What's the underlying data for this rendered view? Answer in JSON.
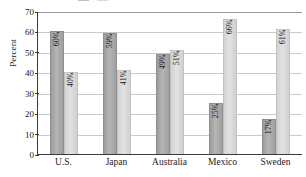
{
  "chart_data": {
    "type": "bar",
    "title": "",
    "xlabel": "",
    "ylabel": "Percent",
    "ylim": [
      0,
      70
    ],
    "ytick_labels": [
      "70",
      "60",
      "50",
      "40",
      "30",
      "20",
      "10",
      "0"
    ],
    "ytick_values": [
      70,
      60,
      50,
      40,
      30,
      20,
      10,
      0
    ],
    "grid": true,
    "legend_position": "top",
    "categories": [
      "U.S.",
      "Japan",
      "Australia",
      "Mexico",
      "Sweden"
    ],
    "series": [
      {
        "name": "series-a",
        "color": "#a8a8a8",
        "values": [
          60,
          59,
          49,
          25,
          17
        ],
        "labels": [
          "60%",
          "59%",
          "49%",
          "25%",
          "17%"
        ]
      },
      {
        "name": "series-b",
        "color": "#d8d8d8",
        "values": [
          40,
          41,
          51,
          66,
          61
        ],
        "labels": [
          "40%",
          "41%",
          "51%",
          "66%",
          "61%"
        ]
      }
    ]
  },
  "axis": {
    "y_title": "Percent"
  },
  "legend": {
    "clipped": true,
    "entry_a": "",
    "entry_b": ""
  }
}
